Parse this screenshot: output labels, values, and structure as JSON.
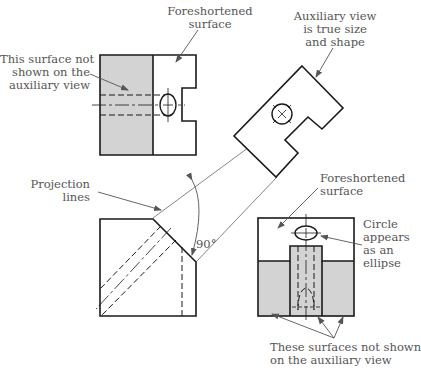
{
  "figure": {
    "colors": {
      "line": "#1a1a1a",
      "thin_line": "#555555",
      "shade": "#d3d3d3",
      "leader": "#555555",
      "text": "#555555"
    },
    "angle_label": "90°",
    "labels": {
      "foreshortened_top": [
        "Foreshortened",
        "surface"
      ],
      "surface_not_shown": [
        "This surface not",
        "shown on the",
        "auxiliary view"
      ],
      "auxiliary_true": [
        "Auxiliary view",
        "is true size",
        "and shape"
      ],
      "projection_lines": [
        "Projection",
        "lines"
      ],
      "foreshortened_bottom": [
        "Foreshortened",
        "surface"
      ],
      "circle_ellipse": [
        "Circle",
        "appears",
        "as an",
        "ellipse"
      ],
      "surfaces_not_shown": [
        "These surfaces not shown",
        "on the auxiliary view"
      ]
    }
  }
}
